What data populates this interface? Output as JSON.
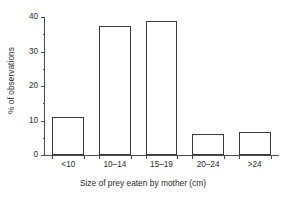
{
  "chart_data": {
    "type": "bar",
    "title": "",
    "categories": [
      "<10",
      "10–14",
      "15–19",
      "20–24",
      ">24"
    ],
    "values": [
      11,
      37.3,
      38.8,
      6,
      6.8
    ],
    "xlabel": "Size of prey eaten by mother (cm)",
    "ylabel": "% of observations",
    "ylim": [
      0,
      40
    ],
    "yticks": [
      0,
      10,
      20,
      30,
      40
    ],
    "ytick_labels": [
      "0",
      "10",
      "20",
      "30",
      "40"
    ],
    "yminor_ticks": [
      5,
      15,
      25,
      35
    ],
    "grid": false,
    "legend": false,
    "bar_facecolor": "#ffffff",
    "bar_edgecolor": "#3a3a3a",
    "axis_color": "#4a4a4a",
    "background": "#ffffff"
  }
}
